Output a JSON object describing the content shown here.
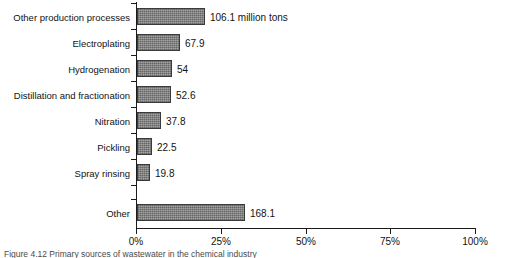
{
  "chart_data": {
    "type": "bar",
    "orientation": "horizontal",
    "title": "",
    "xlabel": "",
    "ylabel": "",
    "xlim": [
      0,
      100
    ],
    "x_tick_labels": [
      "0%",
      "25%",
      "50%",
      "75%",
      "100%"
    ],
    "x_ticks": [
      0,
      25,
      50,
      75,
      100
    ],
    "grid": false,
    "legend": null,
    "unit_note": "million tons",
    "categories": [
      "Other production processes",
      "Electroplating",
      "Hydrogenation",
      "Distillation and fractionation",
      "Nitration",
      "Pickling",
      "Spray rinsing",
      "Other"
    ],
    "values": [
      106.1,
      67.9,
      54,
      52.6,
      37.8,
      22.5,
      19.8,
      168.1
    ],
    "value_labels": [
      "106.1 million tons",
      "67.9",
      "54",
      "52.6",
      "37.8",
      "22.5",
      "19.8",
      "168.1"
    ],
    "percent_of_total": [
      20.1,
      12.8,
      10.2,
      9.9,
      7.1,
      4.3,
      3.7,
      31.8
    ],
    "bar_color": "#8d8d8d",
    "bar_edge_color": "#3a3a3a",
    "axis_color": "#1b1b1b"
  },
  "caption": "Figure 4.12  Primary sources of wastewater in the chemical industry"
}
